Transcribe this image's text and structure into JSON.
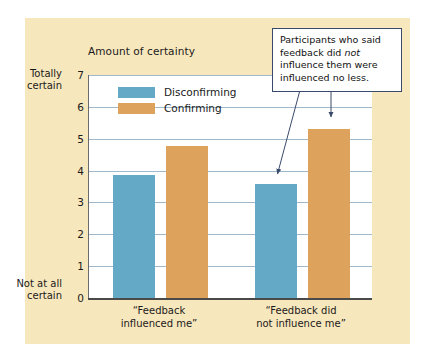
{
  "figure": {
    "background_color": "#f7e7bd",
    "plot_background_color": "#ffffff",
    "gridline_color": "#9fb8cc",
    "axis_color": "#4a4a4a"
  },
  "callout": {
    "text_before": "Participants who said feedback did ",
    "emphasis": "not",
    "text_after": " influence them were influenced no less.",
    "border_color": "#3a4a6b"
  },
  "axis_captions": {
    "top": "Totally\ncertain",
    "top_line1": "Totally",
    "top_line2": "certain",
    "bottom_line1": "Not at all",
    "bottom_line2": "certain"
  },
  "chart_data": {
    "type": "bar",
    "title": "Amount of certainty",
    "xlabel": "",
    "ylabel": "Amount of certainty",
    "ylim": [
      0,
      7
    ],
    "yticks": [
      0,
      1,
      2,
      3,
      4,
      5,
      6,
      7
    ],
    "grid": true,
    "legend_position": "inside-top-left",
    "categories": [
      "“Feedback influenced me”",
      "“Feedback did not influence me”"
    ],
    "category_lines": [
      [
        "“Feedback",
        "influenced me”"
      ],
      [
        "“Feedback did",
        "not influence me”"
      ]
    ],
    "series": [
      {
        "name": "Disconfirming",
        "color": "#64a9c6",
        "values": [
          3.85,
          3.57
        ]
      },
      {
        "name": "Confirming",
        "color": "#dda25c",
        "values": [
          4.78,
          5.3
        ]
      }
    ],
    "annotations": [
      {
        "text": "Participants who said feedback did not influence them were influenced no less.",
        "points_to": [
          "Disconfirming bar of category 2",
          "Confirming bar of category 2"
        ]
      }
    ]
  }
}
